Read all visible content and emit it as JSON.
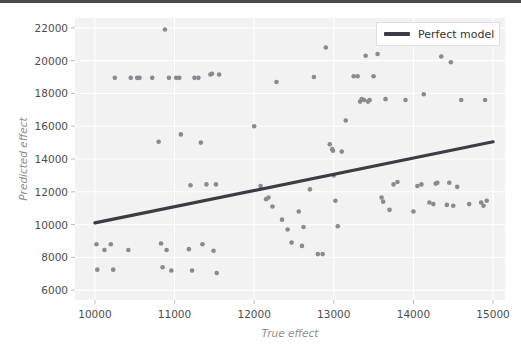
{
  "figure": {
    "background_color": "#ffffff",
    "plot_background_color": "#f2f2f2",
    "grid_color": "#ffffff",
    "marker_color": "#8a8a92",
    "line_color": "#3c3c46",
    "tick_color": "#4d4d4d",
    "axis_label_color": "#8d8d8d"
  },
  "legend": {
    "position": "upper-right",
    "entries": [
      {
        "label": "Perfect model",
        "type": "line",
        "color": "#3c3c46"
      }
    ]
  },
  "chart_data": {
    "type": "scatter",
    "title": "",
    "xlabel": "True effect",
    "ylabel": "Predicted effect",
    "xlim": [
      9750,
      15150
    ],
    "ylim": [
      5400,
      22600
    ],
    "xticks": [
      10000,
      11000,
      12000,
      13000,
      14000,
      15000
    ],
    "yticks": [
      6000,
      8000,
      10000,
      12000,
      14000,
      16000,
      18000,
      20000,
      22000
    ],
    "grid": true,
    "legend_position": "upper right",
    "series": [
      {
        "name": "Predictions",
        "type": "scatter",
        "color": "#8a8a92",
        "marker": "circle",
        "points": [
          [
            10020,
            8800
          ],
          [
            10030,
            7250
          ],
          [
            10120,
            8450
          ],
          [
            10200,
            8800
          ],
          [
            10230,
            7250
          ],
          [
            10250,
            18950
          ],
          [
            10420,
            8450
          ],
          [
            10450,
            18950
          ],
          [
            10530,
            18950
          ],
          [
            10560,
            18950
          ],
          [
            10720,
            18950
          ],
          [
            10800,
            15050
          ],
          [
            10830,
            8850
          ],
          [
            10850,
            7400
          ],
          [
            10880,
            21900
          ],
          [
            10900,
            8450
          ],
          [
            10930,
            18950
          ],
          [
            10960,
            7200
          ],
          [
            11020,
            18950
          ],
          [
            11060,
            18950
          ],
          [
            11080,
            15500
          ],
          [
            11180,
            8500
          ],
          [
            11200,
            12400
          ],
          [
            11220,
            7200
          ],
          [
            11250,
            18950
          ],
          [
            11300,
            18950
          ],
          [
            11330,
            15000
          ],
          [
            11350,
            8800
          ],
          [
            11400,
            12450
          ],
          [
            11450,
            19150
          ],
          [
            11470,
            19200
          ],
          [
            11490,
            8400
          ],
          [
            11520,
            12450
          ],
          [
            11530,
            7050
          ],
          [
            11560,
            19150
          ],
          [
            12000,
            16000
          ],
          [
            12080,
            12350
          ],
          [
            12150,
            11550
          ],
          [
            12180,
            11650
          ],
          [
            12230,
            11100
          ],
          [
            12280,
            18700
          ],
          [
            12350,
            10300
          ],
          [
            12420,
            9700
          ],
          [
            12470,
            8900
          ],
          [
            12560,
            10800
          ],
          [
            12600,
            8700
          ],
          [
            12620,
            9850
          ],
          [
            12700,
            12150
          ],
          [
            12750,
            19000
          ],
          [
            12800,
            8200
          ],
          [
            12860,
            8200
          ],
          [
            12900,
            20800
          ],
          [
            12950,
            14900
          ],
          [
            12980,
            14600
          ],
          [
            12990,
            14500
          ],
          [
            13000,
            13000
          ],
          [
            13020,
            11450
          ],
          [
            13050,
            9900
          ],
          [
            13100,
            14450
          ],
          [
            13150,
            16350
          ],
          [
            13250,
            19050
          ],
          [
            13300,
            19050
          ],
          [
            13330,
            17500
          ],
          [
            13350,
            17650
          ],
          [
            13380,
            17600
          ],
          [
            13400,
            20300
          ],
          [
            13430,
            17500
          ],
          [
            13450,
            17600
          ],
          [
            13500,
            19050
          ],
          [
            13550,
            20400
          ],
          [
            13600,
            11650
          ],
          [
            13620,
            11400
          ],
          [
            13650,
            17650
          ],
          [
            13700,
            10900
          ],
          [
            13750,
            12450
          ],
          [
            13800,
            12600
          ],
          [
            13900,
            17600
          ],
          [
            14000,
            10800
          ],
          [
            14050,
            12350
          ],
          [
            14100,
            12450
          ],
          [
            14130,
            17950
          ],
          [
            14200,
            11350
          ],
          [
            14250,
            11250
          ],
          [
            14280,
            12500
          ],
          [
            14300,
            12550
          ],
          [
            14350,
            20250
          ],
          [
            14420,
            11200
          ],
          [
            14450,
            12550
          ],
          [
            14470,
            19900
          ],
          [
            14500,
            11150
          ],
          [
            14550,
            12300
          ],
          [
            14600,
            17600
          ],
          [
            14700,
            11250
          ],
          [
            14850,
            11350
          ],
          [
            14880,
            11150
          ],
          [
            14900,
            17600
          ],
          [
            14920,
            11450
          ]
        ]
      },
      {
        "name": "Perfect model",
        "type": "line",
        "color": "#3c3c46",
        "x": [
          10000,
          15000
        ],
        "y": [
          10100,
          15050
        ]
      }
    ]
  }
}
